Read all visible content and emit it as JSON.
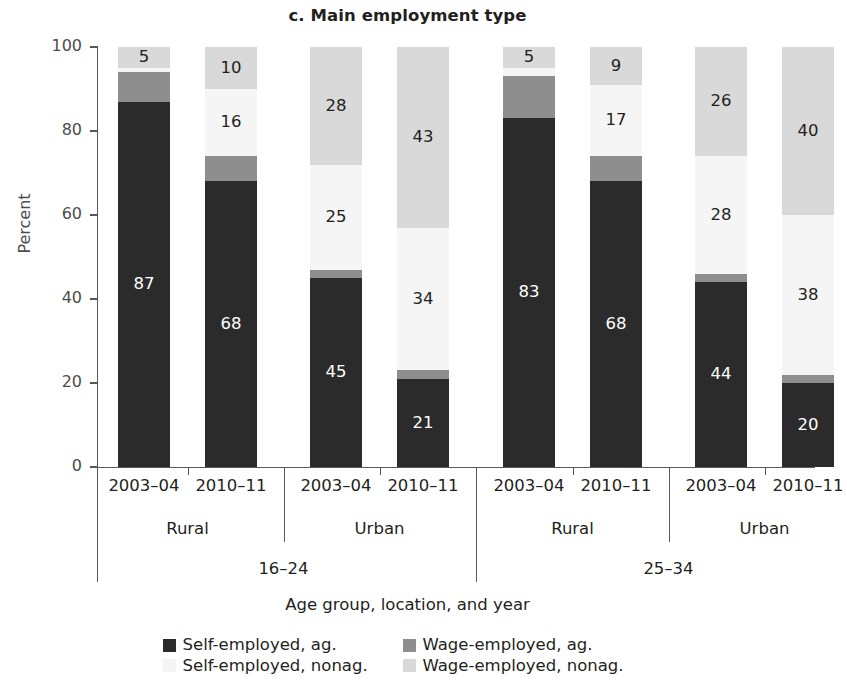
{
  "chart_data": {
    "type": "bar",
    "subtype": "stacked-bar-100",
    "title": "c. Main employment type",
    "xlabel": "Age group, location, and year",
    "ylabel": "Percent",
    "ylim": [
      0,
      100
    ],
    "yticks": [
      0,
      20,
      40,
      60,
      80,
      100
    ],
    "grid": false,
    "legend_position": "bottom",
    "categories": [
      "16-24 / Rural / 2003-04",
      "16-24 / Rural / 2010-11",
      "16-24 / Urban / 2003-04",
      "16-24 / Urban / 2010-11",
      "25-34 / Rural / 2003-04",
      "25-34 / Rural / 2010-11",
      "25-34 / Urban / 2003-04",
      "25-34 / Urban / 2010-11"
    ],
    "series": [
      {
        "name": "Self-employed, ag.",
        "key": "se_ag",
        "color": "#2b2b2b",
        "values": [
          87,
          68,
          45,
          21,
          83,
          68,
          44,
          20
        ]
      },
      {
        "name": "Wage-employed, ag.",
        "key": "we_ag",
        "color": "#8e8e8e",
        "values": [
          7,
          6,
          2,
          2,
          10,
          6,
          2,
          2
        ]
      },
      {
        "name": "Self-employed, nonag.",
        "key": "se_nonag",
        "color": "#f5f5f5",
        "values": [
          1,
          16,
          25,
          34,
          2,
          17,
          28,
          38
        ]
      },
      {
        "name": "Wage-employed, nonag.",
        "key": "we_nonag",
        "color": "#d9d9d9",
        "values": [
          5,
          10,
          28,
          43,
          5,
          9,
          26,
          40
        ]
      }
    ],
    "bar_labels": [
      {
        "se_ag": "87",
        "we_ag": "",
        "se_nonag": "",
        "we_nonag": "5"
      },
      {
        "se_ag": "68",
        "we_ag": "",
        "se_nonag": "16",
        "we_nonag": "10"
      },
      {
        "se_ag": "45",
        "we_ag": "",
        "se_nonag": "25",
        "we_nonag": "28"
      },
      {
        "se_ag": "21",
        "we_ag": "",
        "se_nonag": "34",
        "we_nonag": "43"
      },
      {
        "se_ag": "83",
        "we_ag": "",
        "se_nonag": "",
        "we_nonag": "5"
      },
      {
        "se_ag": "68",
        "we_ag": "",
        "se_nonag": "17",
        "we_nonag": "9"
      },
      {
        "se_ag": "44",
        "we_ag": "",
        "se_nonag": "28",
        "we_nonag": "26"
      },
      {
        "se_ag": "20",
        "we_ag": "",
        "se_nonag": "38",
        "we_nonag": "40"
      }
    ]
  },
  "axis": {
    "y_label": "Percent",
    "y_ticks": [
      "100",
      "80",
      "60",
      "40",
      "20",
      "0"
    ],
    "x_title": "Age group, location, and year",
    "years": [
      "2003–04",
      "2010–11",
      "2003–04",
      "2010–11",
      "2003–04",
      "2010–11",
      "2003–04",
      "2010–11"
    ],
    "locations": [
      "Rural",
      "Urban",
      "Rural",
      "Urban"
    ],
    "age_groups": [
      "16–24",
      "25–34"
    ]
  },
  "title": "c. Main employment type",
  "legend": {
    "items": [
      {
        "label": "Self-employed, ag.",
        "color": "#2b2b2b"
      },
      {
        "label": "Wage-employed, ag.",
        "color": "#8e8e8e"
      },
      {
        "label": "Self-employed, nonag.",
        "color": "#f5f5f5"
      },
      {
        "label": "Wage-employed, nonag.",
        "color": "#d9d9d9"
      }
    ]
  }
}
